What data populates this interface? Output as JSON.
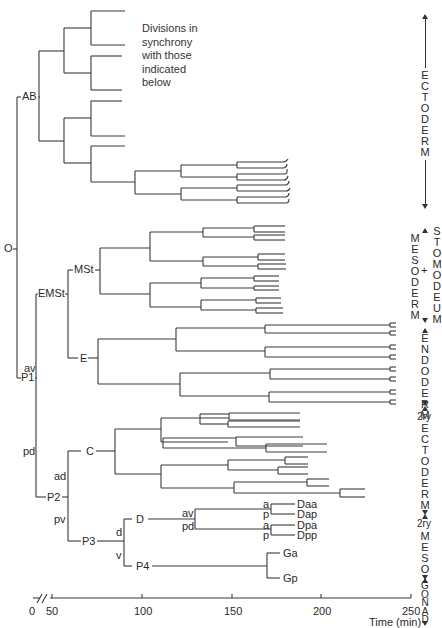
{
  "note": [
    "Divisions in",
    "synchrony",
    "with those",
    "indicated",
    "below"
  ],
  "axis": {
    "title": "Time (min)",
    "ticks": [
      {
        "label": "0",
        "x": 29
      },
      {
        "label": "50",
        "x": 46
      },
      {
        "label": "100",
        "x": 134
      },
      {
        "label": "150",
        "x": 224
      },
      {
        "label": "200",
        "x": 313
      },
      {
        "label": "250",
        "x": 402
      }
    ],
    "break_symbol": "//"
  },
  "nodes": [
    {
      "id": "O",
      "label": "O",
      "x": 4,
      "y": 246
    },
    {
      "id": "AB",
      "label": "AB",
      "x": 22,
      "y": 94
    },
    {
      "id": "P1",
      "label": "P1",
      "x": 20,
      "y": 375
    },
    {
      "id": "EMSt",
      "label": "EMSt",
      "x": 38,
      "y": 291
    },
    {
      "id": "av1",
      "label": "av",
      "x": 24,
      "y": 337
    },
    {
      "id": "MSt",
      "label": "MSt",
      "x": 74,
      "y": 267
    },
    {
      "id": "E",
      "label": "E",
      "x": 80,
      "y": 356
    },
    {
      "id": "pd1",
      "label": "pd",
      "x": 23,
      "y": 446
    },
    {
      "id": "C",
      "label": "C",
      "x": 85,
      "y": 446
    },
    {
      "id": "ad",
      "label": "ad",
      "x": 54,
      "y": 471
    },
    {
      "id": "P2",
      "label": "P2",
      "x": 47,
      "y": 493
    },
    {
      "id": "pv",
      "label": "pv",
      "x": 54,
      "y": 515
    },
    {
      "id": "P3",
      "label": "P3",
      "x": 82,
      "y": 538
    },
    {
      "id": "D",
      "label": "D",
      "x": 136,
      "y": 514
    },
    {
      "id": "d",
      "label": "d",
      "x": 116,
      "y": 526
    },
    {
      "id": "v",
      "label": "v",
      "x": 116,
      "y": 550
    },
    {
      "id": "P4",
      "label": "P4",
      "x": 136,
      "y": 560
    },
    {
      "id": "av2",
      "label": "av",
      "x": 182,
      "y": 509
    },
    {
      "id": "pd2",
      "label": "pd",
      "x": 182,
      "y": 522
    },
    {
      "id": "a1",
      "label": "a",
      "x": 263,
      "y": 501
    },
    {
      "id": "p1",
      "label": "p",
      "x": 263,
      "y": 511
    },
    {
      "id": "a2",
      "label": "a",
      "x": 263,
      "y": 522
    },
    {
      "id": "p2",
      "label": "p",
      "x": 263,
      "y": 532
    },
    {
      "id": "Daa",
      "label": "Daa",
      "x": 297,
      "y": 502
    },
    {
      "id": "Dap",
      "label": "Dap",
      "x": 297,
      "y": 512
    },
    {
      "id": "Dpa",
      "label": "Dpa",
      "x": 297,
      "y": 523
    },
    {
      "id": "Dpp",
      "label": "Dpp",
      "x": 297,
      "y": 533
    },
    {
      "id": "Ga",
      "label": "Ga",
      "x": 283,
      "y": 550
    },
    {
      "id": "Gp",
      "label": "Gp",
      "x": 283,
      "y": 575
    }
  ],
  "tissues": [
    {
      "name": "ectoderm",
      "letters": [
        "E",
        "C",
        "T",
        "O",
        "D",
        "E",
        "R",
        "M"
      ],
      "x": 425,
      "top": 14,
      "bottom": 208,
      "text_top": 70
    },
    {
      "name": "mesoderm",
      "letters": [
        "M",
        "E",
        "S",
        "O",
        "D",
        "E",
        "R",
        "M"
      ],
      "x": 414,
      "top": 245,
      "text_top": 245
    },
    {
      "name": "stomodeum",
      "letters": [
        "S",
        "T",
        "O",
        "M",
        "O",
        "D",
        "E",
        "U",
        "M"
      ],
      "x": 433,
      "top": 228,
      "text_top": 228
    },
    {
      "name": "endoderm",
      "letters": [
        "E",
        "N",
        "D",
        "O",
        "D",
        "E",
        "R",
        "M"
      ],
      "x": 425,
      "top": 262,
      "text_top": 279
    },
    {
      "name": "2ry-ectoderm",
      "prefix": "2ry",
      "letters": [
        "E",
        "C",
        "T",
        "O",
        "D",
        "E",
        "R",
        "M"
      ],
      "x": 425,
      "top": 405,
      "text_top": 425
    },
    {
      "name": "2ry-meso",
      "prefix": "2ry",
      "letters": [
        "M",
        "E",
        "S",
        "O"
      ],
      "x": 425,
      "top": 500,
      "text_top": 516
    },
    {
      "name": "gonad",
      "letters": [
        "G",
        "O",
        "N",
        "A",
        "D"
      ],
      "x": 425,
      "top": 560,
      "text_top": 560
    }
  ],
  "symbols": {
    "plus": "+"
  },
  "colors": {
    "line": "#3a3a3a",
    "text": "#2a2a2a",
    "background": "#ffffff"
  }
}
